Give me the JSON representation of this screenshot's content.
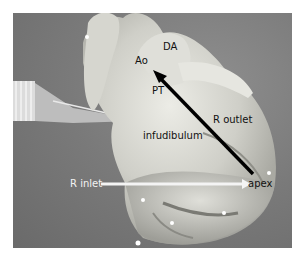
{
  "figure": {
    "labels": {
      "ao": "Ao",
      "da": "DA",
      "pt": "PT",
      "infundibulum": "infudibulum",
      "r_outlet": "R outlet",
      "r_inlet": "R inlet",
      "apex": "apex"
    },
    "arrows": [
      {
        "name": "r-outlet-arrow",
        "from": "apex",
        "to": "PT",
        "color": "#000000"
      },
      {
        "name": "r-inlet-arrow",
        "from": "R inlet",
        "to": "apex",
        "color": "#ffffff"
      }
    ],
    "colors": {
      "background": "#7c7c7c",
      "tissue": "#d8d8d0",
      "border": "#ffffff"
    }
  }
}
